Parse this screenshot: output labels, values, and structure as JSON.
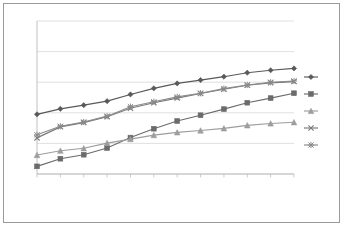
{
  "chart_data": {
    "type": "line",
    "title": "",
    "xlabel": "",
    "ylabel": "",
    "ylim": [
      50,
      100
    ],
    "ytick_values": [
      50,
      60,
      70,
      80,
      90,
      100
    ],
    "ytick_labels": [
      "50%",
      "60%",
      "70%",
      "80%",
      "90%",
      "100%"
    ],
    "grid": true,
    "grid_axis": "y",
    "legend_position": "right",
    "categories": [
      "2007年",
      "2008年",
      "2009年",
      "2010年",
      "2011年",
      "2012年",
      "2013年",
      "2014年",
      "2015年",
      "2016年",
      "2017年",
      "2018年"
    ],
    "series": [
      {
        "name": "A",
        "marker": "diamond",
        "color": "#595959",
        "values": [
          69.5,
          71.3,
          72.5,
          73.8,
          76.0,
          78.0,
          79.6,
          80.7,
          81.8,
          83.1,
          83.9,
          84.5
        ]
      },
      {
        "name": "B",
        "marker": "square",
        "color": "#6b6b6b",
        "values": [
          52.5,
          55.0,
          56.3,
          58.5,
          61.9,
          64.8,
          67.3,
          69.2,
          71.2,
          73.3,
          74.8,
          76.4
        ]
      },
      {
        "name": "C",
        "marker": "triangle",
        "color": "#9d9d9d",
        "values": [
          56.2,
          57.6,
          58.4,
          60.1,
          61.4,
          62.7,
          63.6,
          64.2,
          64.9,
          65.9,
          66.5,
          66.9
        ]
      },
      {
        "name": "D",
        "marker": "cross",
        "color": "#7a7a7a",
        "values": [
          61.8,
          65.4,
          66.8,
          68.7,
          71.5,
          73.3,
          74.8,
          76.3,
          77.7,
          79.0,
          79.8,
          80.2
        ]
      },
      {
        "name": "E",
        "marker": "asterisk",
        "color": "#8a8a8a",
        "values": [
          62.8,
          65.6,
          67.0,
          68.9,
          72.0,
          73.6,
          75.2,
          76.4,
          77.9,
          79.1,
          80.0,
          80.4
        ]
      }
    ]
  },
  "legend": {
    "entries": [
      {
        "label": "A"
      },
      {
        "label": "B"
      },
      {
        "label": "C"
      },
      {
        "label": "D"
      },
      {
        "label": "E"
      }
    ]
  }
}
